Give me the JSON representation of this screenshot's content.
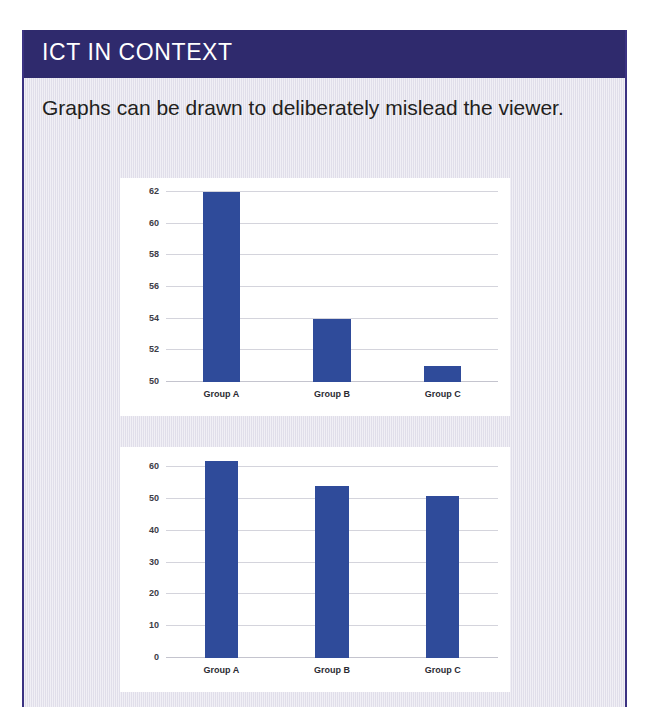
{
  "box": {
    "header_title": "ICT IN CONTEXT",
    "intro_text": "Graphs can be drawn to deliberately mislead the viewer.",
    "accent_color": "#2f2a6d",
    "border_color": "#3b3282",
    "background_color": "#e7e5ef"
  },
  "chart_data": [
    {
      "id": "truncated-axis-chart",
      "type": "bar",
      "title": "",
      "xlabel": "",
      "ylabel": "",
      "categories": [
        "Group A",
        "Group B",
        "Group C"
      ],
      "values": [
        62,
        54,
        51
      ],
      "ylim": [
        50,
        62
      ],
      "yticks": [
        50,
        52,
        54,
        56,
        58,
        60,
        62
      ],
      "ytick_labels": [
        "50",
        "52",
        "54",
        "56",
        "58",
        "60",
        "62"
      ],
      "grid": true,
      "legend": "none",
      "bar_color": "#2f4b9a",
      "bar_width_ratio": 0.34,
      "note": "truncated y-axis starting at 50 exaggerates differences"
    },
    {
      "id": "full-scale-chart",
      "type": "bar",
      "title": "",
      "xlabel": "",
      "ylabel": "",
      "categories": [
        "Group A",
        "Group B",
        "Group C"
      ],
      "values": [
        62,
        54,
        51
      ],
      "ylim": [
        0,
        62
      ],
      "yticks": [
        0,
        10,
        20,
        30,
        40,
        50,
        60
      ],
      "ytick_labels": [
        "0",
        "10",
        "20",
        "30",
        "40",
        "50",
        "60"
      ],
      "grid": true,
      "legend": "none",
      "bar_color": "#2f4b9a",
      "bar_width_ratio": 0.3,
      "note": "full y-axis starting at 0 shows true proportions"
    }
  ]
}
